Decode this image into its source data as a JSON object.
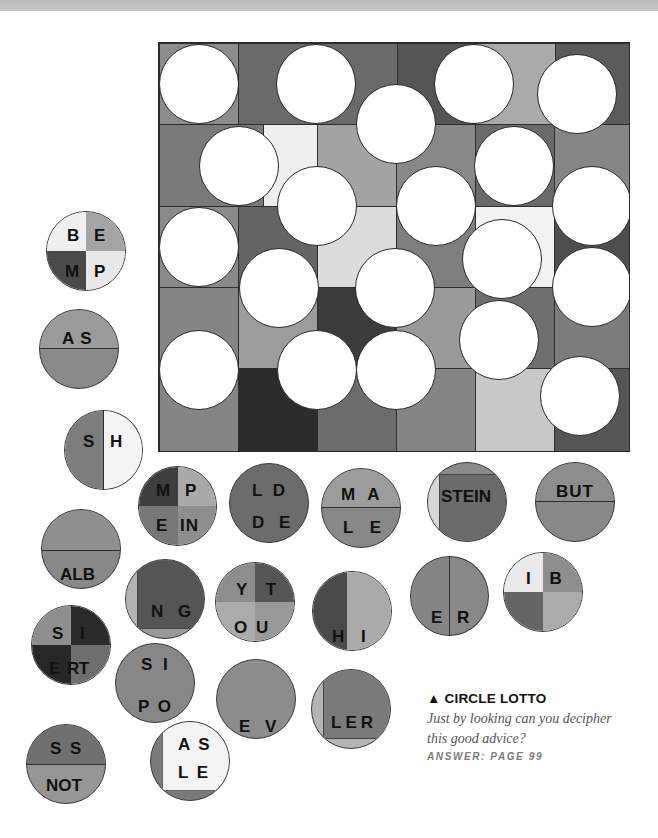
{
  "puzzle": {
    "title": "CIRCLE LOTTO",
    "title_icon": "triangle-up-icon",
    "prompt_line1": "Just by looking can you decipher",
    "prompt_line2": "this good advice?",
    "answer_ref": "ANSWER: PAGE 99"
  },
  "colors": {
    "black_outline": "#2a2a2a",
    "hole": "#ffffff",
    "text": "#111111"
  },
  "board": {
    "columns": 6,
    "rows": 5,
    "holes": 22
  },
  "pieces": [
    {
      "id": "BEMP",
      "labels": [
        "B E",
        "M P"
      ]
    },
    {
      "id": "AS",
      "labels": [
        "A S"
      ]
    },
    {
      "id": "SH",
      "labels": [
        "S H"
      ]
    },
    {
      "id": "MPEIN",
      "labels": [
        "M P",
        "E IN"
      ]
    },
    {
      "id": "LDDE",
      "labels": [
        "L D",
        "D E"
      ]
    },
    {
      "id": "MALE",
      "labels": [
        "M A",
        "L E"
      ]
    },
    {
      "id": "STEIN",
      "labels": [
        "STEIN"
      ]
    },
    {
      "id": "BUT",
      "labels": [
        "BUT"
      ]
    },
    {
      "id": "ALB",
      "labels": [
        "ALB"
      ]
    },
    {
      "id": "NG",
      "labels": [
        "N G"
      ]
    },
    {
      "id": "YTOU",
      "labels": [
        "Y T",
        "O U"
      ]
    },
    {
      "id": "HI",
      "labels": [
        "H I"
      ]
    },
    {
      "id": "ER",
      "labels": [
        "E R"
      ]
    },
    {
      "id": "IB",
      "labels": [
        "I B"
      ]
    },
    {
      "id": "SIERT",
      "labels": [
        "S I",
        "E RT"
      ]
    },
    {
      "id": "SIPO",
      "labels": [
        "S I",
        "P O"
      ]
    },
    {
      "id": "EV",
      "labels": [
        "E V"
      ]
    },
    {
      "id": "LER",
      "labels": [
        "LER"
      ]
    },
    {
      "id": "SSNOT",
      "labels": [
        "S S",
        "NOT"
      ]
    },
    {
      "id": "ASLE",
      "labels": [
        "A S",
        "L E"
      ]
    }
  ]
}
